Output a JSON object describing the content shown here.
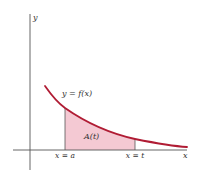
{
  "diagram": {
    "type": "area-under-curve",
    "axes": {
      "x_label": "x",
      "y_label": "y"
    },
    "curve": {
      "label": "y = f(x)",
      "color": "#b01c34",
      "description": "decreasing convex function"
    },
    "region": {
      "label": "A(t)",
      "fill": "#f4c9d3",
      "left_bound_label": "x = a",
      "right_bound_label": "x = t"
    }
  }
}
